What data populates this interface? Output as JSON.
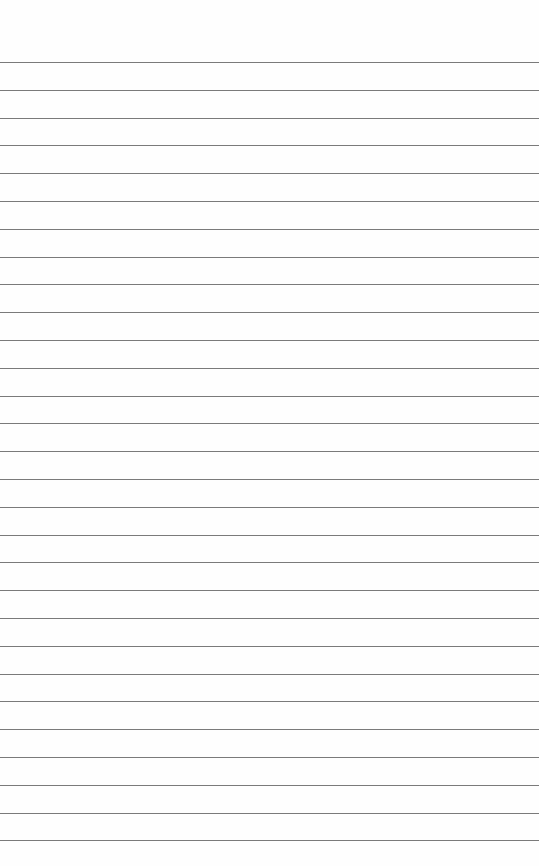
{
  "paper": {
    "type": "lined-paper",
    "background": "#fefefe",
    "line_color": "#7a7a7a",
    "line_count": 29,
    "first_line_y": 62,
    "line_spacing": 27.8
  }
}
